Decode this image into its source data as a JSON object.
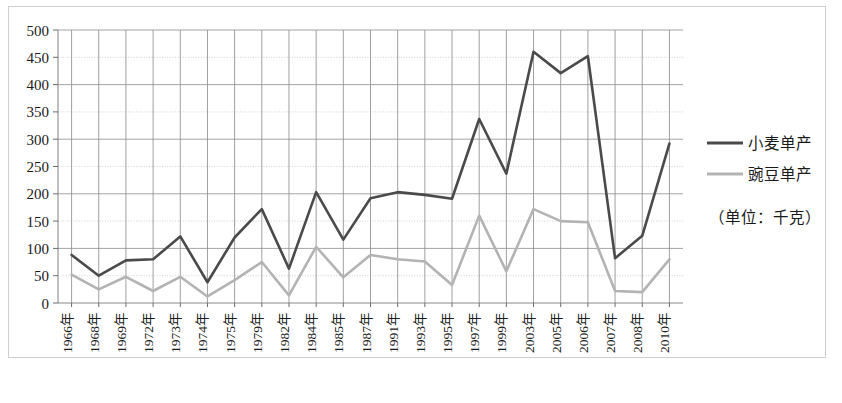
{
  "chart_data": {
    "type": "line",
    "title": "",
    "xlabel": "",
    "ylabel": "",
    "ylim": [
      0,
      500
    ],
    "ytick_step": 50,
    "grid": true,
    "legend_position": "right",
    "unit_note": "（单位：千克）",
    "categories": [
      "1966年",
      "1968年",
      "1969年",
      "1972年",
      "1973年",
      "1974年",
      "1975年",
      "1979年",
      "1982年",
      "1984年",
      "1985年",
      "1987年",
      "1991年",
      "1993年",
      "1995年",
      "1997年",
      "1999年",
      "2003年",
      "2005年",
      "2006年",
      "2007年",
      "2008年",
      "2010年"
    ],
    "yticks": [
      0,
      50,
      100,
      150,
      200,
      250,
      300,
      350,
      400,
      450,
      500
    ],
    "series": [
      {
        "name": "小麦单产",
        "color": "#4a4a4a",
        "width": 2.6,
        "values": [
          88,
          50,
          78,
          80,
          122,
          38,
          120,
          172,
          63,
          203,
          116,
          192,
          203,
          198,
          191,
          337,
          237,
          460,
          421,
          452,
          82,
          123,
          292
        ]
      },
      {
        "name": "豌豆单产",
        "color": "#b3b3b3",
        "width": 2.6,
        "values": [
          52,
          25,
          48,
          22,
          48,
          12,
          42,
          75,
          14,
          103,
          47,
          88,
          80,
          76,
          33,
          160,
          58,
          172,
          150,
          148,
          22,
          20,
          80
        ]
      }
    ]
  },
  "legend": {
    "items": [
      {
        "label": "小麦单产",
        "color": "#4a4a4a"
      },
      {
        "label": "豌豆单产",
        "color": "#b3b3b3"
      }
    ],
    "unit": "（单位：千克）"
  },
  "axis": {
    "y_min_label": "0",
    "y_max_label": "500"
  }
}
